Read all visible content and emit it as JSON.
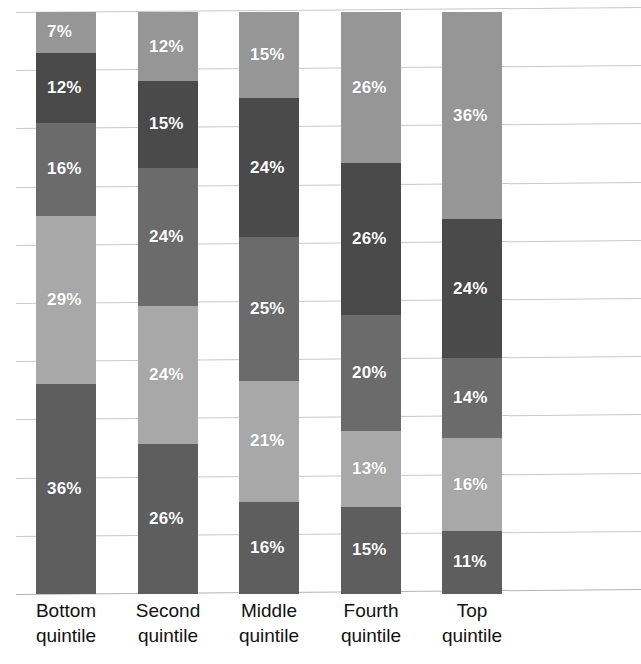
{
  "chart_data": {
    "type": "bar",
    "subtype": "stacked-bar-100",
    "title": "",
    "subtitle": "",
    "xlabel": "",
    "ylabel": "",
    "ylim": [
      0,
      100
    ],
    "grid": true,
    "gridline_step": 10,
    "legend": "none",
    "categories": [
      "Bottom quintile",
      "Second quintile",
      "Middle quintile",
      "Fourth quintile",
      "Top quintile"
    ],
    "category_lines": [
      [
        "Bottom",
        "quintile"
      ],
      [
        "Second",
        "quintile"
      ],
      [
        "Middle",
        "quintile"
      ],
      [
        "Fourth",
        "quintile"
      ],
      [
        "Top",
        "quintile"
      ]
    ],
    "series": [
      {
        "name": "series-1",
        "color": "#5e5e5e",
        "values": [
          36,
          26,
          16,
          15,
          11
        ]
      },
      {
        "name": "series-2",
        "color": "#a8a8a8",
        "values": [
          29,
          24,
          21,
          13,
          16
        ]
      },
      {
        "name": "series-3",
        "color": "#6b6b6b",
        "values": [
          16,
          24,
          25,
          20,
          14
        ]
      },
      {
        "name": "series-4",
        "color": "#4a4a4a",
        "values": [
          12,
          15,
          24,
          26,
          24
        ]
      },
      {
        "name": "series-5",
        "color": "#969696",
        "values": [
          7,
          12,
          15,
          26,
          36
        ]
      }
    ],
    "bar_labels": [
      [
        "36%",
        "29%",
        "16%",
        "12%",
        "7%"
      ],
      [
        "26%",
        "24%",
        "24%",
        "15%",
        "12%"
      ],
      [
        "16%",
        "21%",
        "25%",
        "24%",
        "15%"
      ],
      [
        "15%",
        "13%",
        "20%",
        "26%",
        "26%"
      ],
      [
        "11%",
        "16%",
        "14%",
        "24%",
        "36%"
      ]
    ],
    "colors": {
      "series_1": "#5e5e5e",
      "series_2": "#a8a8a8",
      "series_3": "#6b6b6b",
      "series_4": "#4a4a4a",
      "series_5": "#969696",
      "gridline": "#c8c8c8",
      "background": "#ffffff",
      "label_text": "#ffffff",
      "axis_text": "#111111"
    },
    "bar_geometry": [
      {
        "left": 36,
        "width": 60
      },
      {
        "left": 138,
        "width": 60
      },
      {
        "left": 239,
        "width": 60
      },
      {
        "left": 341,
        "width": 60
      },
      {
        "left": 442,
        "width": 60
      }
    ],
    "gridline_values": [
      100,
      90,
      80,
      70,
      60,
      50,
      40,
      30,
      20,
      10,
      0
    ]
  }
}
